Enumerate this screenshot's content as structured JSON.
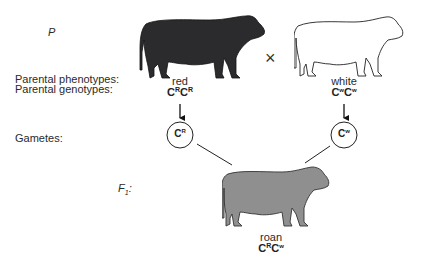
{
  "generation_labels": {
    "parental": "P",
    "f1_base": "F",
    "f1_sub": "1",
    "f1_suffix": ":"
  },
  "row_labels": {
    "phenotypes": "Parental phenotypes:",
    "genotypes": "Parental genotypes:",
    "gametes": "Gametes:"
  },
  "cross_symbol": "×",
  "parents": [
    {
      "id": "red-cow",
      "phenotype": "red",
      "genotype": [
        {
          "base": "C",
          "sup": "R"
        },
        {
          "base": "C",
          "sup": "R"
        }
      ],
      "gamete": {
        "base": "C",
        "sup": "R"
      },
      "color": "#2b2b2e"
    },
    {
      "id": "white-cow",
      "phenotype": "white",
      "genotype": [
        {
          "base": "C",
          "sup": "W"
        },
        {
          "base": "C",
          "sup": "W"
        }
      ],
      "gamete": {
        "base": "C",
        "sup": "W"
      },
      "color": "#ffffff"
    }
  ],
  "offspring": {
    "phenotype": "roan",
    "genotype": [
      {
        "base": "C",
        "sup": "R"
      },
      {
        "base": "C",
        "sup": "W"
      }
    ],
    "color": "#8f8f8f"
  }
}
